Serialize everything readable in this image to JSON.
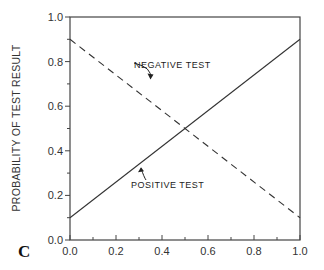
{
  "chart_data": {
    "type": "line",
    "title": "",
    "panel_label": "C",
    "xlabel": "",
    "ylabel": "PROBABILITY OF TEST RESULT",
    "xlim": [
      0.0,
      1.0
    ],
    "ylim": [
      0.0,
      1.0
    ],
    "xticks": [
      "0.0",
      "0.2",
      "0.4",
      "0.6",
      "0.8",
      "1.0"
    ],
    "yticks": [
      "0.0",
      "0.2",
      "0.4",
      "0.6",
      "0.8",
      "1.0"
    ],
    "grid": false,
    "series": [
      {
        "name": "NEGATIVE TEST",
        "style": "dashed",
        "x": [
          0.0,
          1.0
        ],
        "y": [
          0.9,
          0.1
        ]
      },
      {
        "name": "POSITIVE TEST",
        "style": "solid",
        "x": [
          0.0,
          1.0
        ],
        "y": [
          0.1,
          0.9
        ]
      }
    ],
    "annotations": [
      {
        "text": "NEGATIVE TEST",
        "arrow_to": [
          0.35,
          0.72
        ]
      },
      {
        "text": "POSITIVE TEST",
        "arrow_to": [
          0.3,
          0.34
        ]
      }
    ]
  }
}
